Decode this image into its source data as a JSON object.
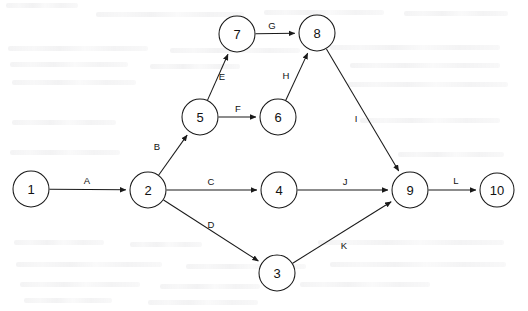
{
  "diagram": {
    "type": "directed-graph",
    "canvas": {
      "width": 528,
      "height": 311
    },
    "style": {
      "node_radius": 18,
      "node_fill": "#ffffff",
      "stroke_color": "#1a1a1a",
      "background": "#ffffff",
      "text_color": "#111111"
    },
    "nodes": [
      {
        "id": "1",
        "label": "1",
        "x": 31,
        "y": 189,
        "r": 18
      },
      {
        "id": "2",
        "label": "2",
        "x": 148,
        "y": 190,
        "r": 18
      },
      {
        "id": "3",
        "label": "3",
        "x": 277,
        "y": 273,
        "r": 18
      },
      {
        "id": "4",
        "label": "4",
        "x": 279,
        "y": 190,
        "r": 18
      },
      {
        "id": "5",
        "label": "5",
        "x": 200,
        "y": 117,
        "r": 18
      },
      {
        "id": "6",
        "label": "6",
        "x": 278,
        "y": 117,
        "r": 18
      },
      {
        "id": "7",
        "label": "7",
        "x": 237,
        "y": 34,
        "r": 18
      },
      {
        "id": "8",
        "label": "8",
        "x": 317,
        "y": 33,
        "r": 18
      },
      {
        "id": "9",
        "label": "9",
        "x": 410,
        "y": 190,
        "r": 18
      },
      {
        "id": "10",
        "label": "10",
        "x": 497,
        "y": 190,
        "r": 17
      }
    ],
    "edges": [
      {
        "id": "A",
        "label": "A",
        "from": "1",
        "to": "2",
        "label_x": 87,
        "label_y": 180
      },
      {
        "id": "B",
        "label": "B",
        "from": "2",
        "to": "5",
        "label_x": 157,
        "label_y": 146
      },
      {
        "id": "C",
        "label": "C",
        "from": "2",
        "to": "4",
        "label_x": 211,
        "label_y": 181
      },
      {
        "id": "D",
        "label": "D",
        "from": "2",
        "to": "3",
        "label_x": 211,
        "label_y": 224
      },
      {
        "id": "E",
        "label": "E",
        "from": "5",
        "to": "7",
        "label_x": 222,
        "label_y": 76
      },
      {
        "id": "F",
        "label": "F",
        "from": "5",
        "to": "6",
        "label_x": 238,
        "label_y": 108
      },
      {
        "id": "G",
        "label": "G",
        "from": "7",
        "to": "8",
        "label_x": 272,
        "label_y": 25
      },
      {
        "id": "H",
        "label": "H",
        "from": "6",
        "to": "8",
        "label_x": 286,
        "label_y": 75
      },
      {
        "id": "I",
        "label": "I",
        "from": "8",
        "to": "9",
        "label_x": 356,
        "label_y": 118
      },
      {
        "id": "J",
        "label": "J",
        "from": "4",
        "to": "9",
        "label_x": 345,
        "label_y": 181
      },
      {
        "id": "K",
        "label": "K",
        "from": "3",
        "to": "9",
        "label_x": 344,
        "label_y": 245
      },
      {
        "id": "L",
        "label": "L",
        "from": "9",
        "to": "10",
        "label_x": 456,
        "label_y": 180
      }
    ]
  }
}
